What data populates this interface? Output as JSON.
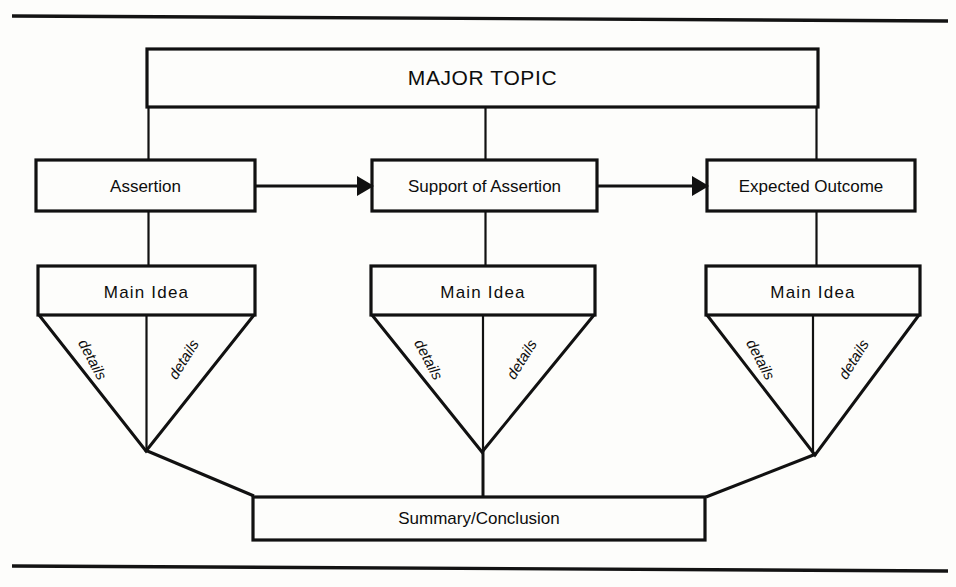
{
  "figure": {
    "type": "flow-diagram",
    "title": "MAJOR TOPIC",
    "rules": {
      "top_rule": "horizontal-rule-top",
      "bottom_rule": "horizontal-rule-bottom"
    }
  },
  "major_topic": {
    "label": "MAJOR TOPIC"
  },
  "stages": [
    {
      "id": "assertion",
      "label": "Assertion"
    },
    {
      "id": "support-of-assertion",
      "label": "Support of Assertion"
    },
    {
      "id": "expected-outcome",
      "label": "Expected Outcome"
    }
  ],
  "arrows": [
    {
      "from": "Assertion",
      "to": "Support of Assertion",
      "glyph": "arrow-right"
    },
    {
      "from": "Support of Assertion",
      "to": "Expected Outcome",
      "glyph": "arrow-right"
    }
  ],
  "main_ideas": [
    {
      "id": "main-idea-1",
      "label": "Main  Idea",
      "details": [
        {
          "side": "left",
          "label": "details"
        },
        {
          "side": "right",
          "label": "details"
        }
      ]
    },
    {
      "id": "main-idea-2",
      "label": "Main  Idea",
      "details": [
        {
          "side": "left",
          "label": "details"
        },
        {
          "side": "right",
          "label": "details"
        }
      ]
    },
    {
      "id": "main-idea-3",
      "label": "Main  Idea",
      "details": [
        {
          "side": "left",
          "label": "details"
        },
        {
          "side": "right",
          "label": "details"
        }
      ]
    }
  ],
  "summary": {
    "label": "Summary/Conclusion"
  },
  "colors": {
    "ink": "#111111",
    "paper": "#fdfdfb"
  }
}
